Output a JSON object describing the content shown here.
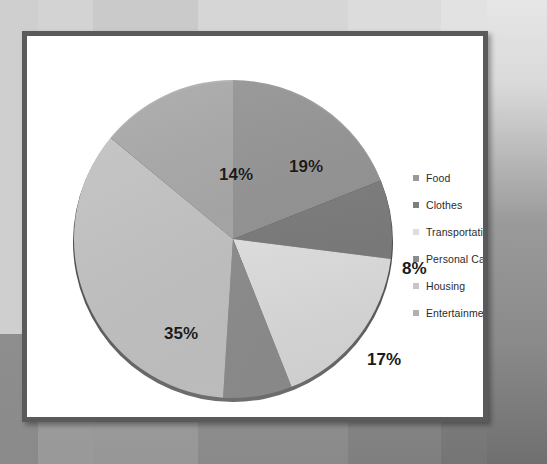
{
  "slide": {
    "frame_color": "#5a5a5a",
    "panel_background": "#ffffff"
  },
  "legend": {
    "position": "right",
    "items": [
      {
        "label": "Food",
        "swatch": "#9a9a9a"
      },
      {
        "label": "Clothes",
        "swatch": "#7e7e7e"
      },
      {
        "label": "Transportation",
        "swatch": "#dcdcdc"
      },
      {
        "label": "Personal Care Items",
        "swatch": "#8c8c8c"
      },
      {
        "label": "Housing",
        "swatch": "#c6c6c6"
      },
      {
        "label": "Entertainment",
        "swatch": "#b0b0b0"
      }
    ]
  },
  "chart_data": {
    "type": "pie",
    "title": "",
    "subtitle": "",
    "xlabel": "",
    "ylabel": "",
    "grid": false,
    "legend_position": "right",
    "units": "percent",
    "start_angle_deg": 0,
    "direction": "clockwise",
    "categories": [
      "Food",
      "Clothes",
      "Transportation",
      "Personal Care Items",
      "Housing",
      "Entertainment"
    ],
    "values": [
      19,
      8,
      17,
      7,
      35,
      14
    ],
    "data_labels": [
      "19%",
      "8%",
      "17%",
      "7%",
      "35%",
      "14%"
    ],
    "colors": [
      "#9a9a9a",
      "#7e7e7e",
      "#dcdcdc",
      "#8c8c8c",
      "#c6c6c6",
      "#b0b0b0"
    ],
    "slices": [
      {
        "label": "Food",
        "value": 19,
        "data_label": "19%",
        "color": "#9a9a9a",
        "start_deg": 0,
        "end_deg": 68.4,
        "label_x": 218,
        "label_y": 95
      },
      {
        "label": "Clothes",
        "value": 8,
        "data_label": "8%",
        "color": "#7e7e7e",
        "start_deg": 68.4,
        "end_deg": 97.2,
        "label_x": 331,
        "label_y": 197
      },
      {
        "label": "Transportation",
        "value": 17,
        "data_label": "17%",
        "color": "#dcdcdc",
        "start_deg": 97.2,
        "end_deg": 158.4,
        "label_x": 296,
        "label_y": 288
      },
      {
        "label": "Personal Care Items",
        "value": 7,
        "data_label": "7%",
        "color": "#8c8c8c",
        "start_deg": 158.4,
        "end_deg": 183.6,
        "label_x": 213,
        "label_y": 355
      },
      {
        "label": "Housing",
        "value": 35,
        "data_label": "35%",
        "color": "#c6c6c6",
        "start_deg": 183.6,
        "end_deg": 309.6,
        "label_x": 93,
        "label_y": 262
      },
      {
        "label": "Entertainment",
        "value": 14,
        "data_label": "14%",
        "color": "#b0b0b0",
        "start_deg": 309.6,
        "end_deg": 360,
        "label_x": 148,
        "label_y": 103
      }
    ]
  }
}
